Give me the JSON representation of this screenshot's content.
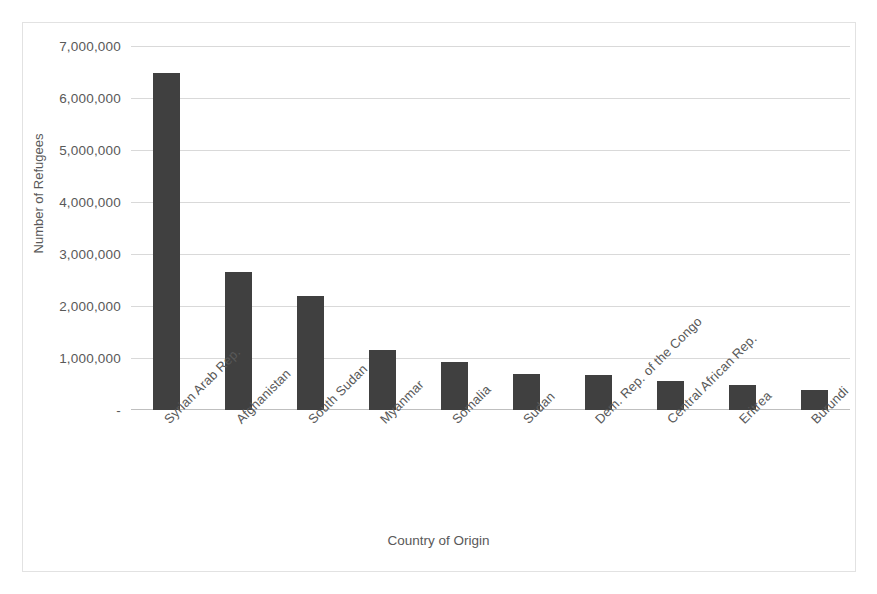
{
  "chart_data": {
    "type": "bar",
    "title": "",
    "xlabel": "Country of Origin",
    "ylabel": "Number of Refugees",
    "grid": true,
    "legend": "none",
    "ylim": [
      0,
      7000000
    ],
    "ytick_step": 1000000,
    "ytick_labels": [
      "7,000,000",
      "6,000,000",
      "5,000,000",
      "4,000,000",
      "3,000,000",
      "2,000,000",
      "1,000,000",
      "-"
    ],
    "ytick_values": [
      7000000,
      6000000,
      5000000,
      4000000,
      3000000,
      2000000,
      1000000,
      0
    ],
    "categories": [
      "Syrian Arab Rep.",
      "Afghanistan",
      "South Sudan",
      "Myanmar",
      "Somalia",
      "Sudan",
      "Dem. Rep. of the Congo",
      "Central African Rep.",
      "Eritrea",
      "Burundi"
    ],
    "values": [
      6480000,
      2650000,
      2200000,
      1160000,
      930000,
      700000,
      670000,
      560000,
      490000,
      390000
    ],
    "bar_color": "#404040",
    "gridline_color": "#d9d9d9",
    "axis_color": "#bfbfbf",
    "text_color": "#595959",
    "frame_color": "#e2e2e2",
    "background": "#ffffff"
  }
}
